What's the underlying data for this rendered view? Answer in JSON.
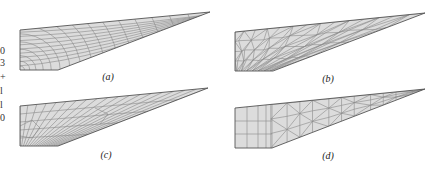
{
  "figure": {
    "type": "finite-element mesh comparison",
    "panels": [
      {
        "id": "a",
        "label": "(a)",
        "mesh": "structured quadrilateral, graded/curved"
      },
      {
        "id": "b",
        "label": "(b)",
        "mesh": "unstructured triangular"
      },
      {
        "id": "c",
        "label": "(c)",
        "mesh": "unstructured quadrilateral (paved)"
      },
      {
        "id": "d",
        "label": "(d)",
        "mesh": "hybrid: quadrilateral block + triangular"
      }
    ]
  },
  "cropped_margin_text": [
    "0",
    "3",
    "+",
    "l",
    "l",
    "0"
  ],
  "colors": {
    "fill": "#dcdcdc",
    "mesh_line": "#8a8a8a",
    "outline": "#555555"
  }
}
